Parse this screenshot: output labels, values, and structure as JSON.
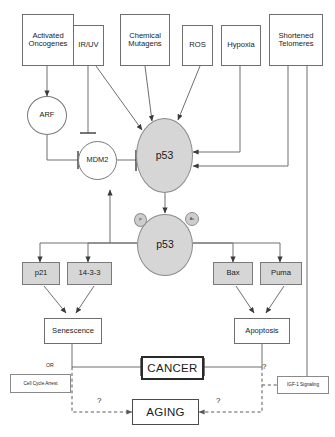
{
  "diagram": {
    "colors": {
      "node_fill": "#d6d6d6",
      "box_fill": "#ffffff",
      "stroke": "#6f6f6f",
      "emphasis": "#2a2a2a"
    }
  },
  "stimuli": [
    {
      "id": "activated-oncogenes",
      "line1": "Activated",
      "line2": "Oncogenes"
    },
    {
      "id": "ir-uv",
      "line1": "IR/UV",
      "line2": ""
    },
    {
      "id": "chemical-mutagens",
      "line1": "Chemical",
      "line2": "Mutagens"
    },
    {
      "id": "ros",
      "line1": "ROS",
      "line2": ""
    },
    {
      "id": "hypoxia",
      "line1": "Hypoxia",
      "line2": ""
    },
    {
      "id": "shortened-telomeres",
      "line1": "Shortened",
      "line2": "Telomeres"
    }
  ],
  "regulators": {
    "arf": "ARF",
    "mdm2": "MDM2"
  },
  "p53": {
    "upper_label": "p53",
    "lower_label": "p53",
    "modifications": [
      {
        "id": "phosphorylation",
        "label": "P"
      },
      {
        "id": "acetylation",
        "label": "Ac"
      }
    ]
  },
  "effectors": {
    "left": [
      {
        "id": "p21",
        "label": "p21"
      },
      {
        "id": "14-3-3",
        "label": "14-3-3"
      }
    ],
    "right": [
      {
        "id": "bax",
        "label": "Bax"
      },
      {
        "id": "puma",
        "label": "Puma"
      }
    ]
  },
  "outcomes": {
    "senescence": "Senescence",
    "apoptosis": "Apoptosis",
    "cancer": "CANCER",
    "aging": "AGING"
  },
  "annotations": {
    "or_label": "OR",
    "cell_cycle_arrest": "Cell Cycle Arrest",
    "igf1_signaling": "IGF-1 Signaling",
    "question_left": "?",
    "question_right": "?",
    "question_igf": "?"
  }
}
